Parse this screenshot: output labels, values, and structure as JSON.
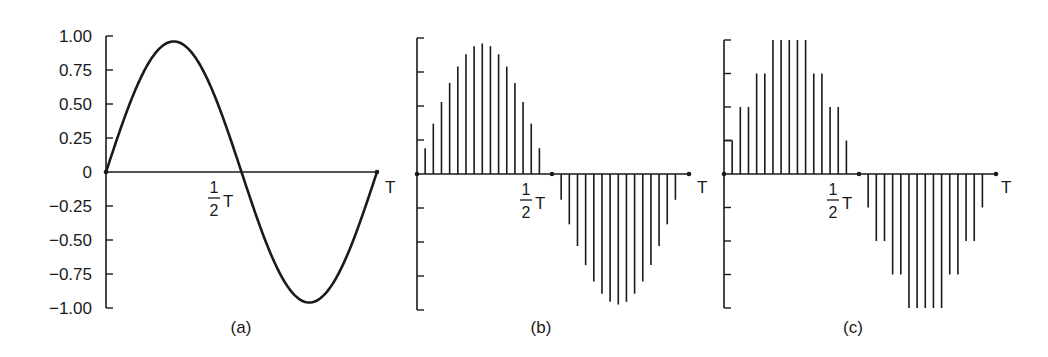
{
  "figure": {
    "panels": [
      {
        "id": "a",
        "caption": "(a)",
        "kind": "continuous sine wave"
      },
      {
        "id": "b",
        "caption": "(b)",
        "kind": "sampled sine wave (PAM)"
      },
      {
        "id": "c",
        "caption": "(c)",
        "kind": "sampled and quantized sine wave"
      }
    ],
    "x_labels": {
      "half_numerator": "1",
      "half_denominator": "2",
      "half_T": "T",
      "end": "T"
    },
    "colors": {
      "ink": "#1a1a1a",
      "background": "#ffffff"
    }
  },
  "chart_data": [
    {
      "type": "line",
      "title": "(a)",
      "xlabel": "",
      "ylabel": "",
      "x_ticks": [
        "1/2 T",
        "T"
      ],
      "y_ticks": [
        "1.00",
        "0.75",
        "0.50",
        "0.25",
        "0",
        "-0.25",
        "-0.50",
        "-0.75",
        "-1.00"
      ],
      "y_tick_values": [
        1.0,
        0.75,
        0.5,
        0.25,
        0,
        -0.25,
        -0.5,
        -0.75,
        -1.0
      ],
      "ylim": [
        -1.0,
        1.0
      ],
      "xlim": [
        0,
        1
      ],
      "x_unit": "T",
      "function": "0.96*sin(2*pi*t/T)",
      "x": [
        0,
        0.125,
        0.25,
        0.375,
        0.5,
        0.625,
        0.75,
        0.875,
        1.0
      ],
      "values": [
        0,
        0.68,
        0.96,
        0.68,
        0,
        -0.68,
        -0.96,
        -0.68,
        0
      ],
      "grid": false
    },
    {
      "type": "bar",
      "title": "(b)",
      "subtype": "stem / sampled",
      "x_ticks": [
        "1/2 T",
        "T"
      ],
      "ylim": [
        -1.0,
        1.0
      ],
      "y_tick_values": [
        1.0,
        0.75,
        0.5,
        0.25,
        0,
        -0.25,
        -0.5,
        -0.75,
        -1.0
      ],
      "n_samples": 30,
      "x": [
        0.03,
        0.06,
        0.09,
        0.12,
        0.15,
        0.18,
        0.21,
        0.24,
        0.27,
        0.3,
        0.33,
        0.36,
        0.39,
        0.42,
        0.45,
        0.53,
        0.56,
        0.59,
        0.62,
        0.65,
        0.68,
        0.71,
        0.74,
        0.77,
        0.8,
        0.83,
        0.86,
        0.89,
        0.92,
        0.95
      ],
      "values": [
        0.19,
        0.37,
        0.53,
        0.67,
        0.79,
        0.88,
        0.94,
        0.96,
        0.94,
        0.88,
        0.79,
        0.67,
        0.53,
        0.37,
        0.19,
        -0.19,
        -0.37,
        -0.53,
        -0.67,
        -0.79,
        -0.88,
        -0.94,
        -0.96,
        -0.94,
        -0.88,
        -0.79,
        -0.67,
        -0.53,
        -0.37,
        -0.19
      ],
      "grid": false
    },
    {
      "type": "bar",
      "title": "(c)",
      "subtype": "stem / quantized to 0.25 steps",
      "x_ticks": [
        "1/2 T",
        "T"
      ],
      "ylim": [
        -1.0,
        1.0
      ],
      "y_tick_values": [
        1.0,
        0.75,
        0.5,
        0.25,
        0,
        -0.25,
        -0.5,
        -0.75,
        -1.0
      ],
      "n_samples": 30,
      "x": [
        0.03,
        0.06,
        0.09,
        0.12,
        0.15,
        0.18,
        0.21,
        0.24,
        0.27,
        0.3,
        0.33,
        0.36,
        0.39,
        0.42,
        0.45,
        0.53,
        0.56,
        0.59,
        0.62,
        0.65,
        0.68,
        0.71,
        0.74,
        0.77,
        0.8,
        0.83,
        0.86,
        0.89,
        0.92,
        0.95
      ],
      "values": [
        0.25,
        0.5,
        0.5,
        0.75,
        0.75,
        1.0,
        1.0,
        1.0,
        1.0,
        1.0,
        0.75,
        0.75,
        0.5,
        0.5,
        0.25,
        -0.25,
        -0.5,
        -0.5,
        -0.75,
        -0.75,
        -1.0,
        -1.0,
        -1.0,
        -1.0,
        -1.0,
        -0.75,
        -0.75,
        -0.5,
        -0.5,
        -0.25
      ],
      "grid": false
    }
  ]
}
